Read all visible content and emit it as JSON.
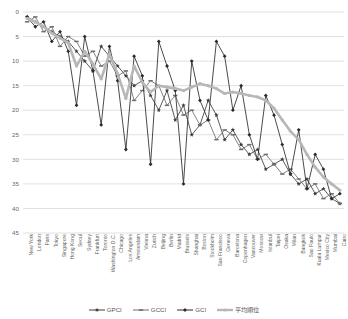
{
  "chart_data": {
    "type": "line",
    "title": "",
    "xlabel": "",
    "ylabel": "",
    "ylim": [
      0,
      45
    ],
    "y_inverted": true,
    "yticks": [
      0,
      5,
      10,
      15,
      20,
      25,
      30,
      35,
      40,
      45
    ],
    "grid": true,
    "legend_position": "bottom",
    "categories": [
      "New York",
      "London",
      "Paris",
      "Tokyo",
      "Singapore",
      "Hong Kong",
      "Seoul",
      "Sydney",
      "Frankfurt",
      "Toronto",
      "Washington D.C.",
      "Chicago",
      "Los Angeles",
      "Amsterdam",
      "Vienna",
      "Zurich",
      "Beijing",
      "Berlin",
      "Madrid",
      "Brussels",
      "Shanghai",
      "Boston",
      "Stockholm",
      "San Francisco",
      "Geneva",
      "Barcelona",
      "Copenhagen",
      "Vancouver",
      "Moscow",
      "Istanbul",
      "Taipei",
      "Osaka",
      "Milan",
      "Bangkok",
      "Sao Paulo",
      "Kuala Lumpur",
      "Mexico City",
      "Mumbai",
      "Cairo"
    ],
    "series": [
      {
        "name": "GPCI",
        "color": "#3c3c3c",
        "marker": "star",
        "values": [
          1,
          2,
          3,
          4,
          5,
          6,
          8,
          10,
          12,
          7,
          9,
          11,
          13,
          15,
          14,
          17,
          20,
          16,
          22,
          19,
          25,
          23,
          18,
          21,
          26,
          24,
          27,
          29,
          28,
          32,
          31,
          30,
          33,
          35,
          34,
          37,
          36,
          38,
          39
        ]
      },
      {
        "name": "GCCI",
        "color": "#6e6e6e",
        "marker": "dash",
        "values": [
          2,
          1,
          4,
          3,
          7,
          5,
          6,
          9,
          8,
          11,
          10,
          13,
          12,
          18,
          16,
          14,
          15,
          19,
          17,
          21,
          20,
          23,
          22,
          26,
          24,
          25,
          28,
          27,
          30,
          29,
          31,
          33,
          32,
          34,
          36,
          35,
          38,
          37,
          39
        ]
      },
      {
        "name": "GCI",
        "color": "#2b2b2b",
        "marker": "diamond",
        "values": [
          1,
          3,
          2,
          6,
          4,
          8,
          19,
          5,
          12,
          23,
          7,
          14,
          28,
          9,
          13,
          31,
          6,
          11,
          16,
          35,
          10,
          18,
          22,
          6,
          9,
          20,
          15,
          25,
          30,
          17,
          21,
          27,
          33,
          24,
          36,
          29,
          32,
          38,
          37
        ]
      },
      {
        "name": "平均順位",
        "color": "#b7b7b7",
        "marker": "trend",
        "values": [
          1.3,
          2,
          3,
          4.3,
          5.3,
          6.3,
          11,
          8,
          10.6,
          13.6,
          8.6,
          12.6,
          17.6,
          11,
          14.3,
          16.3,
          15,
          15.3,
          15.6,
          16,
          15.3,
          14.6,
          15,
          15.6,
          16.6,
          16.3,
          16.6,
          17,
          17.3,
          18,
          19.6,
          22,
          24.3,
          26,
          29,
          31.6,
          33.6,
          35,
          36.3
        ]
      }
    ]
  },
  "legend": {
    "items": [
      {
        "label": "GPCI"
      },
      {
        "label": "GCCI"
      },
      {
        "label": "GCI"
      },
      {
        "label": "平均順位"
      }
    ]
  }
}
